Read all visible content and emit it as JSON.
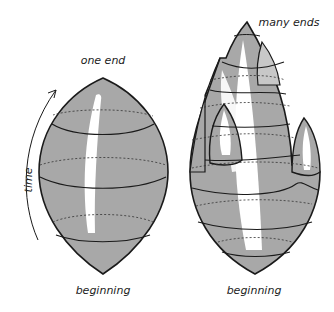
{
  "labels": {
    "left_top": "one end",
    "left_bottom": "beginning",
    "time_axis": "time",
    "right_top": "many ends",
    "right_bottom": "beginning"
  },
  "colors": {
    "fill": "#a8a8a8",
    "highlight": "#ffffff",
    "stroke": "#1a1a1a",
    "background": "#ffffff"
  }
}
